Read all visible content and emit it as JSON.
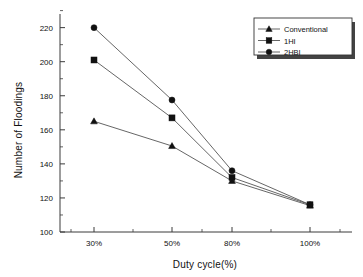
{
  "chart_data": {
    "type": "line",
    "title": "",
    "xlabel": "Duty cycle(%)",
    "ylabel": "Number of Floodings",
    "categories": [
      "30%",
      "50%",
      "80%",
      "100%"
    ],
    "xtick_labels": [
      "30%",
      "50%",
      "80%",
      "100%"
    ],
    "ytick_labels": [
      "100",
      "120",
      "140",
      "160",
      "180",
      "200",
      "220"
    ],
    "ylim": [
      100,
      228
    ],
    "ytick_values": [
      100,
      120,
      140,
      160,
      180,
      200,
      220
    ],
    "grid": false,
    "legend_position": "top-right",
    "series": [
      {
        "name": "Conventional",
        "marker": "triangle",
        "values": [
          165,
          150.5,
          130,
          115.5
        ]
      },
      {
        "name": "1HI",
        "marker": "square",
        "values": [
          201,
          167,
          132,
          116
        ]
      },
      {
        "name": "2HBI",
        "marker": "circle",
        "values": [
          220,
          177.5,
          136,
          116
        ]
      }
    ]
  },
  "legend": {
    "items": [
      {
        "label": "Conventional",
        "marker": "triangle"
      },
      {
        "label": "1HI",
        "marker": "square"
      },
      {
        "label": "2HBI",
        "marker": "circle"
      }
    ]
  },
  "axes": {
    "x_title": "Duty cycle(%)",
    "y_title": "Number of Floodings"
  }
}
